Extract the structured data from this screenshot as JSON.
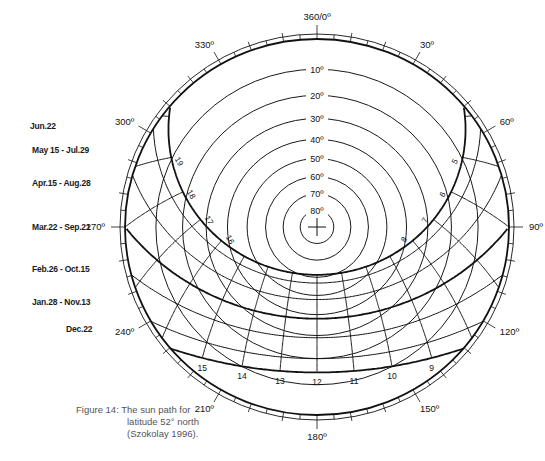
{
  "figure": {
    "title": "Figure 14:",
    "caption_lines": [
      "The sun path for",
      "latitude 52° north",
      "(Szokolay 1996)."
    ],
    "latitude_deg": 52
  },
  "chart_data": {
    "type": "sun-path-diagram",
    "projection": "stereographic",
    "latitude": 52,
    "center_px": [
      317,
      227
    ],
    "radius_px": [
      192,
      188
    ],
    "azimuth_labels": [
      {
        "az": 0,
        "text": "360/0º"
      },
      {
        "az": 30,
        "text": "30º"
      },
      {
        "az": 60,
        "text": "60º"
      },
      {
        "az": 90,
        "text": "90º"
      },
      {
        "az": 120,
        "text": "120º"
      },
      {
        "az": 150,
        "text": "150º"
      },
      {
        "az": 180,
        "text": "180º"
      },
      {
        "az": 210,
        "text": "210º"
      },
      {
        "az": 240,
        "text": "240º"
      },
      {
        "az": 270,
        "text": "270º"
      },
      {
        "az": 300,
        "text": "300º"
      },
      {
        "az": 330,
        "text": "330º"
      }
    ],
    "altitude_circles": [
      {
        "alt": 10,
        "text": "10º"
      },
      {
        "alt": 20,
        "text": "20º"
      },
      {
        "alt": 30,
        "text": "30º"
      },
      {
        "alt": 40,
        "text": "40º"
      },
      {
        "alt": 50,
        "text": "50º"
      },
      {
        "alt": 60,
        "text": "60º"
      },
      {
        "alt": 70,
        "text": "70º"
      },
      {
        "alt": 80,
        "text": "80º"
      }
    ],
    "date_lines": [
      {
        "label": "Jun.22",
        "declination": 23.45,
        "thick": true,
        "label_y": 126
      },
      {
        "label": "May 15 - Jul.29",
        "declination": 18.8,
        "thick": false,
        "label_y": 150
      },
      {
        "label": "Apr.15 - Aug.28",
        "declination": 9.8,
        "thick": false,
        "label_y": 183
      },
      {
        "label": "Mar.22 - Sep.21",
        "declination": 0,
        "thick": true,
        "label_y": 227
      },
      {
        "label": "Feb.26 - Oct.15",
        "declination": -9.0,
        "thick": false,
        "label_y": 269
      },
      {
        "label": "Jan.28 - Nov.13",
        "declination": -18.0,
        "thick": false,
        "label_y": 302
      },
      {
        "label": "Dec.22",
        "declination": -23.45,
        "thick": true,
        "label_y": 329
      }
    ],
    "hour_lines": [
      {
        "hour": 4,
        "label": ""
      },
      {
        "hour": 5,
        "label": "5"
      },
      {
        "hour": 6,
        "label": "6"
      },
      {
        "hour": 7,
        "label": "7"
      },
      {
        "hour": 8,
        "label": "8"
      },
      {
        "hour": 9,
        "label": "9"
      },
      {
        "hour": 10,
        "label": "10"
      },
      {
        "hour": 11,
        "label": "11"
      },
      {
        "hour": 12,
        "label": "12"
      },
      {
        "hour": 13,
        "label": "13"
      },
      {
        "hour": 14,
        "label": "14"
      },
      {
        "hour": 15,
        "label": "15"
      },
      {
        "hour": 16,
        "label": "16"
      },
      {
        "hour": 17,
        "label": "17"
      },
      {
        "hour": 18,
        "label": "18"
      },
      {
        "hour": 19,
        "label": "19"
      },
      {
        "hour": 20,
        "label": ""
      }
    ],
    "summer_hour_labels": [
      "5",
      "6",
      "7",
      "8",
      "16",
      "17",
      "18",
      "19"
    ],
    "winter_hour_labels": [
      "9",
      "10",
      "11",
      "12",
      "13",
      "14",
      "15"
    ],
    "azimuth_tick_step_deg": 5
  }
}
